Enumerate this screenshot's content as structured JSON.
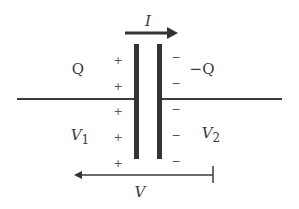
{
  "diagram": {
    "type": "capacitor-schematic",
    "colors": {
      "line": "#3a3a3a",
      "plate": "#333333",
      "text": "#3a3a3a",
      "sign": "#555555",
      "background": "#ffffff"
    },
    "labels": {
      "current": "I",
      "left_charge": "Q",
      "right_charge": "−Q",
      "left_potential_base": "V",
      "left_potential_sub": "1",
      "right_potential_base": "V",
      "right_potential_sub": "2",
      "voltage": "V"
    },
    "plus_signs": [
      "+",
      "+",
      "+",
      "+",
      "+"
    ],
    "minus_signs": [
      "−",
      "−",
      "−",
      "−",
      "−"
    ],
    "current_arrow": {
      "direction": "right"
    },
    "voltage_arrow": {
      "direction": "left"
    }
  }
}
